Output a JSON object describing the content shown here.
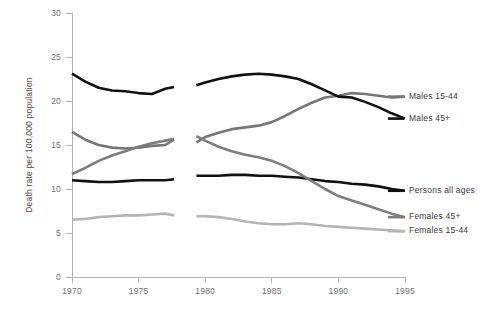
{
  "chart_data": {
    "type": "line",
    "title": "",
    "xlabel": "",
    "ylabel": "Death rate per 100,000 population",
    "xlim": [
      1970,
      1995
    ],
    "ylim": [
      0,
      30
    ],
    "xticks": [
      1970,
      1975,
      1980,
      1985,
      1990,
      1995
    ],
    "yticks": [
      0,
      5,
      10,
      15,
      20,
      25,
      30
    ],
    "grid": false,
    "legend_position": "right",
    "series_break": {
      "after_year": 1978,
      "before_year": 1979,
      "note": "discontinuity between 1978 and 1979"
    },
    "x": [
      1970,
      1971,
      1972,
      1973,
      1974,
      1975,
      1976,
      1977,
      1978,
      1979,
      1980,
      1981,
      1982,
      1983,
      1984,
      1985,
      1986,
      1987,
      1988,
      1989,
      1990,
      1991,
      1992,
      1993,
      1994,
      1995
    ],
    "series": [
      {
        "name": "Males 15-44",
        "color": "#767676",
        "values": [
          16.5,
          15.6,
          15.0,
          14.7,
          14.6,
          14.7,
          14.9,
          15.0,
          15.6,
          15.3,
          15.9,
          16.4,
          16.8,
          17.0,
          17.2,
          17.6,
          18.3,
          19.1,
          19.8,
          20.4,
          20.6,
          20.9,
          20.8,
          20.6,
          20.4,
          20.5
        ]
      },
      {
        "name": "Males 45+",
        "color": "#111111",
        "values": [
          23.1,
          22.2,
          21.5,
          21.2,
          21.1,
          20.9,
          20.8,
          21.4,
          21.6,
          21.8,
          22.1,
          22.5,
          22.8,
          23.0,
          23.1,
          23.0,
          22.8,
          22.5,
          21.9,
          21.2,
          20.5,
          20.4,
          19.9,
          19.3,
          18.6,
          18.0
        ]
      },
      {
        "name": "Persons all ages",
        "color": "#111111",
        "values": [
          11.0,
          10.9,
          10.8,
          10.8,
          10.9,
          11.0,
          11.0,
          11.0,
          11.1,
          11.5,
          11.5,
          11.5,
          11.6,
          11.6,
          11.5,
          11.5,
          11.4,
          11.3,
          11.1,
          10.9,
          10.8,
          10.6,
          10.5,
          10.3,
          10.0,
          9.8
        ]
      },
      {
        "name": "Females 45+",
        "color": "#7d7d7d",
        "values": [
          11.7,
          12.4,
          13.2,
          13.8,
          14.3,
          14.8,
          15.2,
          15.5,
          15.7,
          16.0,
          15.5,
          14.8,
          14.3,
          13.9,
          13.6,
          13.2,
          12.6,
          11.8,
          10.9,
          10.0,
          9.2,
          8.7,
          8.2,
          7.7,
          7.2,
          6.8
        ]
      },
      {
        "name": "Females 15-44",
        "color": "#b4b4b4",
        "values": [
          6.5,
          6.6,
          6.8,
          6.9,
          7.0,
          7.0,
          7.1,
          7.2,
          7.0,
          6.9,
          6.9,
          6.8,
          6.6,
          6.3,
          6.1,
          6.0,
          6.0,
          6.1,
          6.0,
          5.8,
          5.7,
          5.6,
          5.5,
          5.4,
          5.3,
          5.2
        ]
      }
    ],
    "legend": [
      {
        "label": "Males 15-44",
        "color": "#767676",
        "y_value": 20.5
      },
      {
        "label": "Males 45+",
        "color": "#111111",
        "y_value": 18.0
      },
      {
        "label": "Persons all ages",
        "color": "#111111",
        "y_value": 9.8
      },
      {
        "label": "Females 45+",
        "color": "#7d7d7d",
        "y_value": 6.8
      },
      {
        "label": "Females 15-44",
        "color": "#b4b4b4",
        "y_value": 5.2
      }
    ]
  }
}
